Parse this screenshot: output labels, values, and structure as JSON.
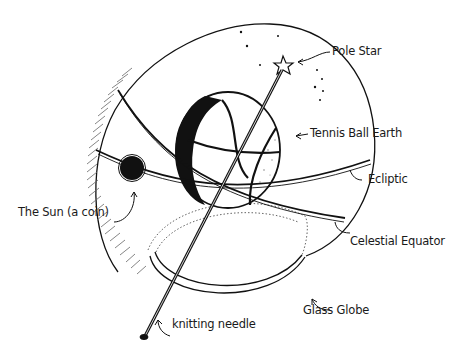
{
  "diagram": {
    "type": "illustration",
    "labels": {
      "pole_star": "Pole Star",
      "tennis_ball_earth": "Tennis Ball Earth",
      "ecliptic": "Ecliptic",
      "the_sun": "The Sun (a coin)",
      "celestial_equator": "Celestial Equator",
      "glass_globe": "Glass Globe",
      "knitting_needle": "knitting needle"
    },
    "colors": {
      "ink": "#111111",
      "paper": "#ffffff",
      "hatch": "#555555"
    }
  }
}
